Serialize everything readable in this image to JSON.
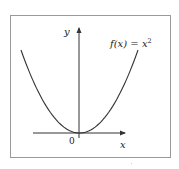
{
  "chart_data": {
    "type": "line",
    "title": "",
    "function_label": "f(x) = x²",
    "function_label_parts": {
      "lhs": "f(x) = x",
      "exponent": "2"
    },
    "xlabel": "x",
    "ylabel": "y",
    "origin_label": "0",
    "series": [
      {
        "name": "f(x) = x^2",
        "x": [
          -1.0,
          -0.75,
          -0.5,
          -0.25,
          0,
          0.25,
          0.5,
          0.75,
          1.0
        ],
        "y": [
          1.0,
          0.5625,
          0.25,
          0.0625,
          0,
          0.0625,
          0.25,
          0.5625,
          1.0
        ]
      }
    ],
    "xlim": [
      -1.0,
      1.0
    ],
    "ylim": [
      0,
      1.0
    ],
    "grid": false,
    "legend": "none",
    "axes_arrows": true,
    "colors": {
      "curve": "#333333",
      "axes": "#333333",
      "frame": "#9a9a9a"
    }
  }
}
